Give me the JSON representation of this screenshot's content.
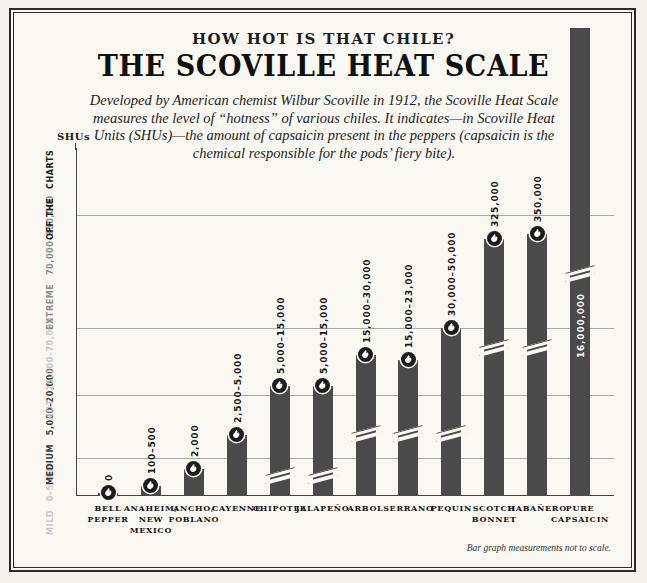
{
  "header": {
    "kicker": "HOW HOT IS THAT CHILE?",
    "title": "THE SCOVILLE HEAT SCALE",
    "deck": "Developed by American chemist Wilbur Scoville in 1912, the Scoville Heat Scale measures the level of “hotness” of various chiles. It indicates—in Scoville Heat Units (SHUs)—the amount of capsaicin present in the peppers (capsaicin is the chemical responsible for the pods’ fiery bite)."
  },
  "axis": {
    "y_label": "SHUs",
    "footnote": "Bar graph measurements not to scale."
  },
  "zones": [
    {
      "name": "MILD",
      "range": "0–5,000",
      "color": "#c9c9c9"
    },
    {
      "name": "MEDIUM",
      "range": "5,000–20,000",
      "color": "#3a3a3a"
    },
    {
      "name": "HOT",
      "range": "25,000–70,000",
      "color": "#c9c9c9"
    },
    {
      "name": "EXTREME",
      "range": "70,000–350,000",
      "color": "#8c8c8c"
    },
    {
      "name": "OFF THE",
      "range": "CHARTS",
      "color": "#1b1b1b"
    }
  ],
  "chart_data": {
    "type": "bar",
    "title": "THE SCOVILLE HEAT SCALE",
    "xlabel": "",
    "ylabel": "SHUs",
    "grid": true,
    "note": "Bar graph measurements not to scale.",
    "categories": [
      "BELL PEPPER",
      "ANAHEIM/ NEW MEXICO",
      "ANCHO/ POBLANO",
      "CAYENNE",
      "CHIPOTLE",
      "JALAPEÑO",
      "ARBOL",
      "SERRANO",
      "PEQUIN",
      "SCOTCH BONNET",
      "HABAÑERO",
      "PURE CAPSAICIN"
    ],
    "value_labels": [
      "0",
      "100–500",
      "2,000",
      "2,500–5,000",
      "5,000–15,000",
      "5,000–15,000",
      "15,000–30,000",
      "15,000–23,000",
      "30,000–50,000",
      "325,000",
      "350,000",
      "16,000,000"
    ],
    "values": [
      0,
      500,
      2000,
      5000,
      15000,
      15000,
      30000,
      23000,
      50000,
      325000,
      350000,
      16000000
    ],
    "value_min": [
      0,
      100,
      2000,
      2500,
      5000,
      5000,
      15000,
      15000,
      30000,
      325000,
      350000,
      16000000
    ],
    "value_max": [
      0,
      500,
      2000,
      5000,
      15000,
      15000,
      30000,
      23000,
      50000,
      325000,
      350000,
      16000000
    ]
  },
  "bars": [
    {
      "label": "BELL PEPPER",
      "value_label": "0",
      "h": 3,
      "break": false,
      "label_inside": false,
      "cat_lines": [
        "BELL",
        "PEPPER"
      ]
    },
    {
      "label": "ANAHEIM/NEW MEXICO",
      "value_label": "100–500",
      "h": 10,
      "break": false,
      "label_inside": false,
      "cat_lines": [
        "ANAHEIM/",
        "NEW",
        "MEXICO"
      ]
    },
    {
      "label": "ANCHO/POBLANO",
      "value_label": "2,000",
      "h": 27,
      "break": false,
      "label_inside": false,
      "cat_lines": [
        "ANCHO/",
        "POBLANO"
      ]
    },
    {
      "label": "CAYENNE",
      "value_label": "2,500–5,000",
      "h": 61,
      "break": false,
      "label_inside": false,
      "cat_lines": [
        "CAYENNE"
      ]
    },
    {
      "label": "CHIPOTLE",
      "value_label": "5,000–15,000",
      "h": 110,
      "break": true,
      "break_at": 20,
      "label_inside": false,
      "cat_lines": [
        "CHIPOTLE"
      ]
    },
    {
      "label": "JALAPEÑO",
      "value_label": "5,000–15,000",
      "h": 110,
      "break": true,
      "break_at": 20,
      "label_inside": false,
      "cat_lines": [
        "JALAPEÑO"
      ]
    },
    {
      "label": "ARBOL",
      "value_label": "15,000–30,000",
      "h": 141,
      "break": true,
      "break_at": 62,
      "label_inside": false,
      "cat_lines": [
        "ARBOL"
      ]
    },
    {
      "label": "SERRANO",
      "value_label": "15,000–23,000",
      "h": 136,
      "break": true,
      "break_at": 62,
      "label_inside": false,
      "cat_lines": [
        "SERRANO"
      ]
    },
    {
      "label": "PEQUIN",
      "value_label": "30,000–50,000",
      "h": 168,
      "break": true,
      "break_at": 62,
      "label_inside": false,
      "cat_lines": [
        "PEQUIN"
      ]
    },
    {
      "label": "SCOTCH BONNET",
      "value_label": "325,000",
      "h": 257,
      "break": true,
      "break_at": 148,
      "label_inside": false,
      "cat_lines": [
        "SCOTCH",
        "BONNET"
      ]
    },
    {
      "label": "HABAÑERO",
      "value_label": "350,000",
      "h": 262,
      "break": true,
      "break_at": 148,
      "label_inside": false,
      "cat_lines": [
        "HABAÑERO"
      ]
    },
    {
      "label": "PURE CAPSAICIN",
      "value_label": "16,000,000",
      "h": 468,
      "break": true,
      "break_at": 222,
      "label_inside": true,
      "cat_lines": [
        "PURE",
        "CAPSAICIN"
      ]
    }
  ]
}
